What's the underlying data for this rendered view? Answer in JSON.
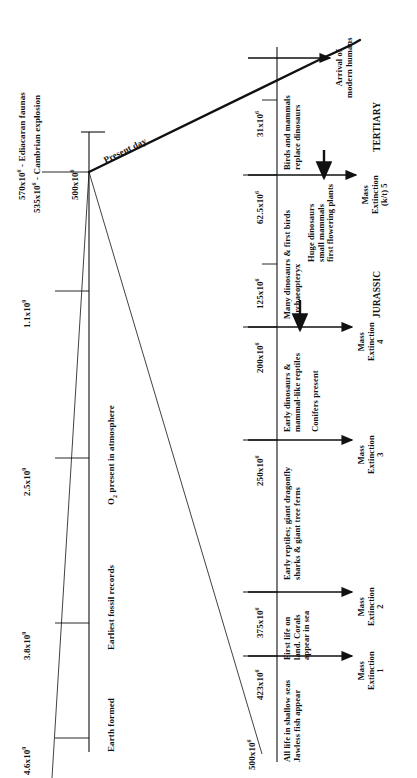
{
  "figure": {
    "type": "geological-timeline-diagram",
    "orientation": "rotated-90-ccw"
  },
  "main_axis": {
    "name": "deep-time-axis",
    "events": [
      {
        "id": "earth-formed",
        "time": "4.6x10",
        "exp": "9",
        "label": "Earth formed"
      },
      {
        "id": "fossil-records",
        "time": "3.8x10",
        "exp": "9",
        "label": "Earliest fossil records"
      },
      {
        "id": "oxygen",
        "time": "2.5x10",
        "exp": "9",
        "label": "O2 present in atmosphere",
        "label_pre": "O",
        "label_sub": "2",
        "label_post": " present in atmosphere"
      },
      {
        "id": "unlabelled-tick",
        "time": "1.1x10",
        "exp": "9",
        "label": ""
      },
      {
        "id": "ediacaran",
        "time": "570x10",
        "exp": "6",
        "label": " - Ediacaran faunas"
      },
      {
        "id": "cambrian",
        "time": "535x10",
        "exp": "6",
        "label": " - Cambrian explosion"
      },
      {
        "id": "zoom-origin",
        "time": "500x10",
        "exp": "6",
        "label": ""
      }
    ],
    "present_day_label": "Present day"
  },
  "detail_axis": {
    "name": "expanded-phanerozoic-axis",
    "start_time": "500x10",
    "start_exp": "6",
    "ticks": [
      {
        "id": "t-423",
        "time": "423x10",
        "exp": "6"
      },
      {
        "id": "t-375",
        "time": "375x10",
        "exp": "6"
      },
      {
        "id": "t-250",
        "time": "250x10",
        "exp": "6"
      },
      {
        "id": "t-200",
        "time": "200x10",
        "exp": "6"
      },
      {
        "id": "t-125",
        "time": "125x10",
        "exp": "6"
      },
      {
        "id": "t-62-5",
        "time": "62.5x10",
        "exp": "6"
      },
      {
        "id": "t-31",
        "time": "31x10",
        "exp": "6"
      }
    ],
    "extinctions": [
      {
        "id": "me-1",
        "title": "Mass",
        "title2": "Extinction",
        "num": "1"
      },
      {
        "id": "me-2",
        "title": "Mass",
        "title2": "Extinction",
        "num": "2"
      },
      {
        "id": "me-3",
        "title": "Mass",
        "title2": "Extinction",
        "num": "3"
      },
      {
        "id": "me-4",
        "title": "Mass",
        "title2": "Extinction",
        "num": "4"
      },
      {
        "id": "me-5",
        "title": "Mass",
        "title2": "Extinction",
        "num": "(k/t) 5"
      }
    ],
    "arrival": {
      "line1": "Arrival of",
      "line2": "modern humans"
    },
    "periods": [
      {
        "id": "jurassic",
        "label": "JURASSIC"
      },
      {
        "id": "tertiary",
        "label": "TERTIARY"
      }
    ],
    "biota": [
      {
        "id": "b-shallow-seas",
        "line1": "All life in shallow seas",
        "line2": "Jawless fish appear"
      },
      {
        "id": "b-first-land",
        "line1": "First life on",
        "line2": "land.  Corals",
        "line3": "appear in sea"
      },
      {
        "id": "b-reptiles",
        "line1": "Early reptiles; giant dragonfly",
        "line2": "sharks & giant tree ferns"
      },
      {
        "id": "b-early-dino",
        "line1": "Early dinosaurs &",
        "line2": "mammal-like reptiles"
      },
      {
        "id": "b-conifers",
        "line1": "Conifers present"
      },
      {
        "id": "b-many-dino",
        "line1": "Many dinosaurs & first birds",
        "line2": "Archaeopteryx"
      },
      {
        "id": "b-huge-dino",
        "line1": "Huge dinosaurs",
        "line2": "small mammals",
        "line3": "first flowering plants"
      },
      {
        "id": "b-birds-mammals",
        "line1": "Birds and mammals",
        "line2": "replace dinosaurs"
      }
    ]
  },
  "colors": {
    "ink": "#111111",
    "background": "#ffffff"
  }
}
